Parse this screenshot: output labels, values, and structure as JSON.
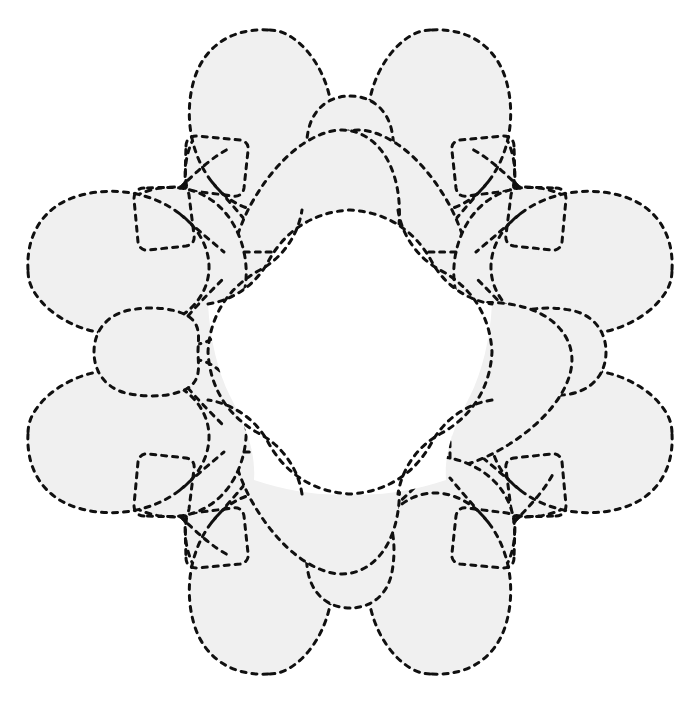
{
  "document": {
    "title": "Dashed Outline Floral Wreath Pattern",
    "canvas_width": 699,
    "canvas_height": 703,
    "background_color": "#ffffff"
  },
  "style": {
    "fill_color": "#f0f0f0",
    "stroke_color": "#101010",
    "stroke_width": 3,
    "dash_pattern": "5 6",
    "hole_color": "#ffffff"
  },
  "figure": {
    "kind": "radial-symmetric-blob-wreath",
    "symmetry": "4-fold rotational with mirror (D4)",
    "center_x": 350,
    "center_y": 352,
    "outer_radius": 325,
    "inner_hole_radius": 135,
    "unit_count": 4,
    "unit_rotations_deg": [
      0,
      90,
      180,
      270
    ]
  },
  "shapes": {
    "note": "Each quadrant unit is mirrored about its own axis and contains: a pair of large outer petals, a small central cap ellipse, two mid-size body lobes, a small rounded-square inset, and connecting arcs.",
    "unit_parts": [
      "outer-petal-left",
      "outer-petal-right",
      "cap-ellipse",
      "body-lobe-left",
      "body-lobe-right",
      "rounded-square-inset",
      "corner-connector-arc"
    ]
  }
}
